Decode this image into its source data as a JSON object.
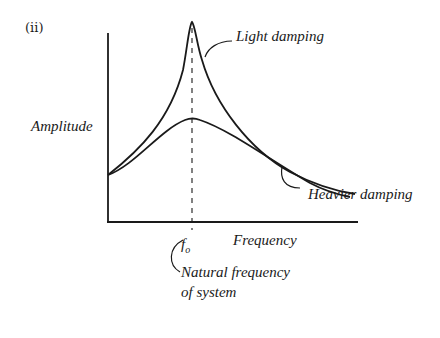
{
  "diagram": {
    "part_label": "(ii)",
    "y_axis_label": "Amplitude",
    "x_axis_label": "Frequency",
    "peak_marker": {
      "symbol": "f",
      "subscript": "o"
    },
    "peak_annotation": {
      "line1": "Natural frequency",
      "line2": "of system"
    },
    "curves": [
      {
        "name": "Light damping",
        "label": "Light damping",
        "peak": "sharp, tall"
      },
      {
        "name": "Heavier damping",
        "label": "Heavier damping",
        "peak": "broad, low"
      }
    ],
    "colors": {
      "ink": "#1a1a1a",
      "background": "#ffffff"
    }
  }
}
